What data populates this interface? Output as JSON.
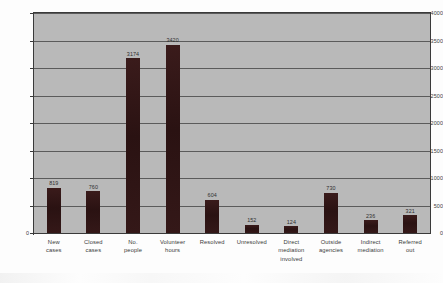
{
  "chart_data": {
    "type": "bar",
    "title": "",
    "subtitle": "",
    "xlabel": "",
    "ylabel": "",
    "ylim": [
      0,
      4000
    ],
    "ytick_step": 500,
    "yticks": [
      "4000",
      "3500",
      "3000",
      "2500",
      "2000",
      "1500",
      "1000",
      "500",
      "0"
    ],
    "grid": true,
    "legend": "none",
    "plot_background": "#b9b9b9",
    "bar_color": "#2e1616",
    "categories": [
      "New cases",
      "Closed cases",
      "No. people",
      "Volunteer hours",
      "Resolved",
      "Unresolved",
      "Direct mediation involved",
      "Outside agencies",
      "Indirect mediation",
      "Referred out"
    ],
    "category_lines": [
      [
        "New",
        "cases"
      ],
      [
        "Closed",
        "cases"
      ],
      [
        "No.",
        "people"
      ],
      [
        "Volunteer",
        "hours"
      ],
      [
        "Resolved"
      ],
      [
        "Unresolved"
      ],
      [
        "Direct",
        "mediation",
        "involved"
      ],
      [
        "Outside",
        "agencies"
      ],
      [
        "Indirect",
        "mediation"
      ],
      [
        "Referred",
        "out"
      ]
    ],
    "values": [
      819,
      760,
      3174,
      3420,
      604,
      152,
      124,
      730,
      236,
      321
    ],
    "value_labels": [
      "819",
      "760",
      "3174",
      "3420",
      "604",
      "152",
      "124",
      "730",
      "236",
      "321"
    ]
  }
}
